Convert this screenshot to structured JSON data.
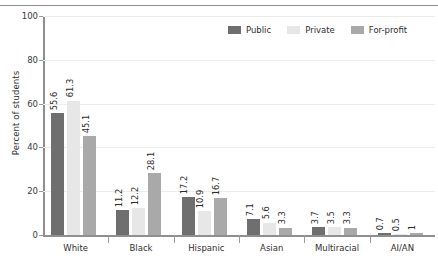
{
  "chart_data": {
    "type": "bar",
    "title": "",
    "subtitle": "",
    "xlabel": "",
    "ylabel": "Percent of students",
    "ylim": [
      0,
      100
    ],
    "yticks": [
      0,
      20,
      40,
      60,
      80,
      100
    ],
    "grid": true,
    "legend_position": "top-right",
    "categories": [
      "White",
      "Black",
      "Hispanic",
      "Asian",
      "Multiracial",
      "AI/AN"
    ],
    "series": [
      {
        "name": "Public",
        "color": "#6f6f6f",
        "values": [
          55.6,
          11.2,
          17.2,
          7.1,
          3.7,
          0.7
        ],
        "labels": [
          "55.6",
          "11.2",
          "17.2",
          "7.1",
          "3.7",
          "0.7"
        ]
      },
      {
        "name": "Private",
        "color": "#e7e7e7",
        "values": [
          61.3,
          12.2,
          10.9,
          5.6,
          3.5,
          0.5
        ],
        "labels": [
          "61.3",
          "12.2",
          "10.9",
          "5.6",
          "3.5",
          "0.5"
        ]
      },
      {
        "name": "For-profit",
        "color": "#a9a9a9",
        "values": [
          45.1,
          28.1,
          16.7,
          3.3,
          3.3,
          1.0
        ],
        "labels": [
          "45.1",
          "28.1",
          "16.7",
          "3.3",
          "3.3",
          "1"
        ]
      }
    ]
  },
  "axis": {
    "ylabel": "Percent of students",
    "ytick_labels": [
      "0",
      "20",
      "40",
      "60",
      "80",
      "100"
    ]
  },
  "legend": {
    "items": [
      {
        "label": "Public",
        "color": "#6f6f6f"
      },
      {
        "label": "Private",
        "color": "#e7e7e7"
      },
      {
        "label": "For-profit",
        "color": "#a9a9a9"
      }
    ]
  }
}
